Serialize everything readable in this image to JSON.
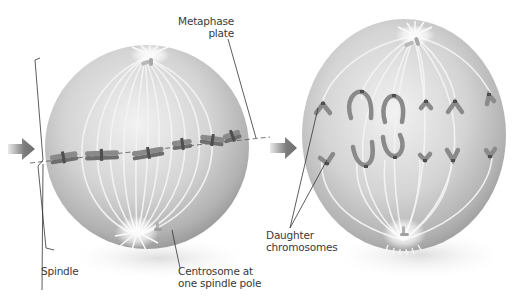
{
  "figure": {
    "panels": [
      {
        "id": "metaphase",
        "description": "Cell in metaphase: chromosomes aligned at the metaphase plate, spindle fibers from two centrosomes"
      },
      {
        "id": "anaphase",
        "description": "Cell in anaphase: daughter chromosomes moving toward opposite spindle poles"
      }
    ],
    "labels": {
      "metaphase_plate": {
        "line1": "Metaphase",
        "line2": "plate"
      },
      "spindle": {
        "line1": "Spindle"
      },
      "centrosome": {
        "line1": "Centrosome at",
        "line2": "one spindle pole"
      },
      "daughter_chromosomes": {
        "line1": "Daughter",
        "line2": "chromosomes"
      }
    },
    "colors": {
      "cell_light": "#ededed",
      "cell_mid": "#c4c4c4",
      "cell_dark": "#8e8e8e",
      "fiber": "#f2f2f2",
      "chromosome": "#8a8a8a",
      "chromosome_dark": "#5e5e5e",
      "arrow": "#6e6e6e",
      "leader_line": "#333333",
      "text": "#3a3a3a"
    }
  }
}
